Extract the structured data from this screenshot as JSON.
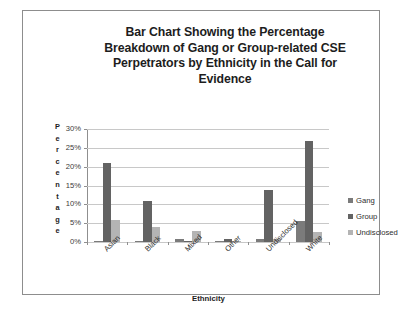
{
  "chart_data": {
    "type": "bar",
    "title": "Bar Chart Showing the Percentage Breakdown of Gang or Group-related CSE Perpetrators by Ethnicity in the Call for Evidence",
    "title_lines": [
      "Bar Chart Showing the Percentage",
      "Breakdown of Gang or Group-related CSE",
      "Perpetrators by Ethnicity in the Call for",
      "Evidence"
    ],
    "xlabel": "Ethnicity",
    "ylabel": "Percentage",
    "ylabel_letters": [
      "P",
      "e",
      "r",
      "c",
      "e",
      "n",
      "t",
      "a",
      "g",
      "e"
    ],
    "categories": [
      "Asian",
      "Black",
      "Mixed",
      "Other",
      "Undisclosed",
      "White"
    ],
    "ylim": [
      0,
      30
    ],
    "yticks": [
      0,
      5,
      10,
      15,
      20,
      25,
      30
    ],
    "ytick_labels": [
      "0%",
      "5%",
      "10%",
      "15%",
      "20%",
      "25%",
      "30%"
    ],
    "grid": true,
    "legend_position": "right",
    "series": [
      {
        "name": "Gang",
        "color": "#7b7b7b",
        "values": [
          0.4,
          0.4,
          0.8,
          0.2,
          0.8,
          5.7
        ]
      },
      {
        "name": "Group",
        "color": "#636363",
        "values": [
          21.0,
          11.0,
          0.2,
          0.8,
          13.8,
          26.8
        ]
      },
      {
        "name": "Undisclosed",
        "color": "#b4b4b4",
        "values": [
          5.8,
          3.9,
          2.8,
          0.2,
          0.8,
          2.7
        ]
      }
    ]
  }
}
